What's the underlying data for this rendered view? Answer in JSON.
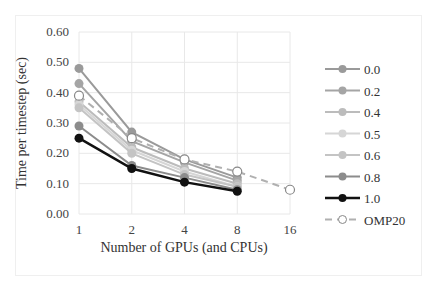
{
  "chart_data": {
    "type": "line",
    "title": "",
    "xlabel": "Number of GPUs  (and CPUs)",
    "ylabel": "Time per timestep (sec)",
    "categories": [
      "1",
      "2",
      "4",
      "8",
      "16"
    ],
    "ylim": [
      0,
      0.6
    ],
    "yticks": [
      "0.00",
      "0.10",
      "0.20",
      "0.30",
      "0.40",
      "0.50",
      "0.60"
    ],
    "grid": true,
    "legend_position": "right",
    "series": [
      {
        "name": "0.0",
        "values": [
          0.48,
          0.27,
          0.18,
          0.12,
          null
        ],
        "color": "#9a9a9a",
        "marker": "filled",
        "dash": false
      },
      {
        "name": "0.2",
        "values": [
          0.43,
          0.24,
          0.17,
          0.11,
          null
        ],
        "color": "#a5a5a5",
        "marker": "filled",
        "dash": false
      },
      {
        "name": "0.4",
        "values": [
          0.37,
          0.22,
          0.15,
          0.1,
          null
        ],
        "color": "#bcbcbc",
        "marker": "filled",
        "dash": false
      },
      {
        "name": "0.5",
        "values": [
          0.36,
          0.21,
          0.14,
          0.09,
          null
        ],
        "color": "#d6d6d6",
        "marker": "filled",
        "dash": false
      },
      {
        "name": "0.6",
        "values": [
          0.35,
          0.2,
          0.13,
          0.09,
          null
        ],
        "color": "#c4c4c4",
        "marker": "filled",
        "dash": false
      },
      {
        "name": "0.8",
        "values": [
          0.29,
          0.16,
          0.12,
          0.08,
          null
        ],
        "color": "#8c8c8c",
        "marker": "filled",
        "dash": false
      },
      {
        "name": "1.0",
        "values": [
          0.25,
          0.15,
          0.105,
          0.075,
          null
        ],
        "color": "#111111",
        "marker": "filled",
        "dash": false
      },
      {
        "name": "OMP20",
        "values": [
          0.39,
          0.25,
          0.18,
          0.14,
          0.08
        ],
        "color": "#b0b0b0",
        "marker": "hollow",
        "dash": true
      }
    ]
  }
}
